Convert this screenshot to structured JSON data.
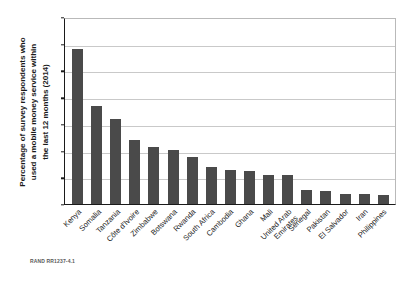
{
  "figure": {
    "credit": "RAND RR1237-4.1"
  },
  "chart_data": {
    "type": "bar",
    "title": "",
    "xlabel": "",
    "ylabel": "Percentage of survey respondents who used a mobile money service within the last 12 months (2014)",
    "ylabel_lines": [
      "Percentage of survey respondents who",
      "used a mobile money service within",
      "the last 12 months (2014)"
    ],
    "ylim": [
      0,
      70
    ],
    "yticks": [
      0,
      10,
      20,
      30,
      40,
      50,
      60,
      70
    ],
    "grid": true,
    "legend": "none",
    "bar_color": "#4a4a4a",
    "categories": [
      "Kenya",
      "Somalia",
      "Tanzania",
      "Côte d'Ivoire",
      "Zimbabwe",
      "Botswana",
      "Rwanda",
      "South Africa",
      "Cambodia",
      "Ghana",
      "Mali",
      "United Arab Emirates",
      "Senegal",
      "Pakistan",
      "El Salvador",
      "Iran",
      "Philippines"
    ],
    "category_lines": [
      [
        "Kenya"
      ],
      [
        "Somalia"
      ],
      [
        "Tanzania"
      ],
      [
        "Côte d'Ivoire"
      ],
      [
        "Zimbabwe"
      ],
      [
        "Botswana"
      ],
      [
        "Rwanda"
      ],
      [
        "South Africa"
      ],
      [
        "Cambodia"
      ],
      [
        "Ghana"
      ],
      [
        "Mali"
      ],
      [
        "United Arab",
        "Emirates"
      ],
      [
        "Senegal"
      ],
      [
        "Pakistan"
      ],
      [
        "El Salvador"
      ],
      [
        "Iran"
      ],
      [
        "Philippines"
      ]
    ],
    "values": [
      58.0,
      36.7,
      32.0,
      23.9,
      21.2,
      20.3,
      17.6,
      14.0,
      12.8,
      12.4,
      11.0,
      10.9,
      5.4,
      5.0,
      3.8,
      3.7,
      3.4
    ]
  }
}
